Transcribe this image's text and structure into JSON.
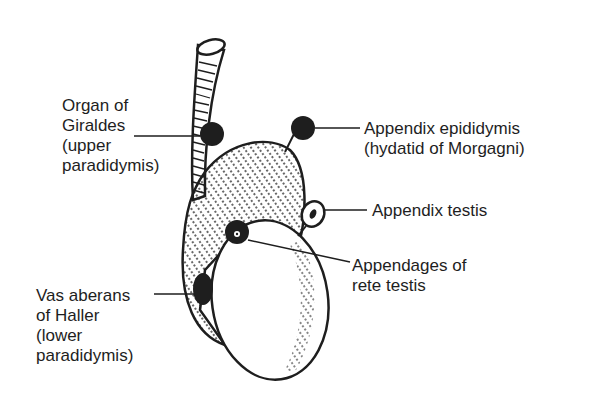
{
  "diagram": {
    "colors": {
      "ink": "#1e1e1e",
      "background": "#ffffff"
    },
    "labels": {
      "organ_of_giraldes": [
        "Organ of",
        "Giraldes",
        "(upper",
        "paradidymis)"
      ],
      "appendix_epididymis": [
        "Appendix epididymis",
        "(hydatid of Morgagni)"
      ],
      "appendix_testis": [
        "Appendix testis"
      ],
      "appendages_rete_testis": [
        "Appendages of",
        "rete testis"
      ],
      "vas_aberans": [
        "Vas aberans",
        "of Haller",
        "(lower",
        "paradidymis)"
      ]
    }
  }
}
